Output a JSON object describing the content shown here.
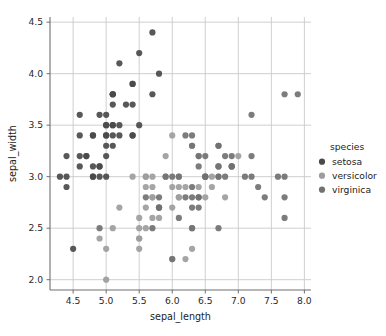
{
  "chart_data": {
    "type": "scatter",
    "title": "",
    "xlabel": "sepal_length",
    "ylabel": "sepal_width",
    "xlim": [
      4.15,
      8.1
    ],
    "ylim": [
      1.9,
      4.55
    ],
    "xticks": [
      "4.5",
      "5.0",
      "5.5",
      "6.0",
      "6.5",
      "7.0",
      "7.5",
      "8.0"
    ],
    "xtick_values": [
      4.5,
      5.0,
      5.5,
      6.0,
      6.5,
      7.0,
      7.5,
      8.0
    ],
    "yticks": [
      "2.0",
      "2.5",
      "3.0",
      "3.5",
      "4.0",
      "4.5"
    ],
    "ytick_values": [
      2.0,
      2.5,
      3.0,
      3.5,
      4.0,
      4.5
    ],
    "grid": true,
    "grid_color": "#c9c9c9",
    "axes_color": "#6f6f6f",
    "background": "#ffffff",
    "legend": {
      "title": "species",
      "position": "right",
      "entries": [
        {
          "label": "setosa",
          "color": "#4a4a4a"
        },
        {
          "label": "versicolor",
          "color": "#9d9d9d"
        },
        {
          "label": "virginica",
          "color": "#717171"
        }
      ]
    },
    "marker_size": 3.1,
    "series": [
      {
        "name": "setosa",
        "color": "#4a4a4a",
        "points": [
          [
            5.1,
            3.5
          ],
          [
            4.9,
            3.0
          ],
          [
            4.7,
            3.2
          ],
          [
            4.6,
            3.1
          ],
          [
            5.0,
            3.6
          ],
          [
            5.4,
            3.9
          ],
          [
            4.6,
            3.4
          ],
          [
            5.0,
            3.4
          ],
          [
            4.4,
            2.9
          ],
          [
            4.9,
            3.1
          ],
          [
            5.4,
            3.7
          ],
          [
            4.8,
            3.4
          ],
          [
            4.8,
            3.0
          ],
          [
            4.3,
            3.0
          ],
          [
            5.8,
            4.0
          ],
          [
            5.7,
            4.4
          ],
          [
            5.4,
            3.9
          ],
          [
            5.1,
            3.5
          ],
          [
            5.7,
            3.8
          ],
          [
            5.1,
            3.8
          ],
          [
            5.4,
            3.4
          ],
          [
            5.1,
            3.7
          ],
          [
            4.6,
            3.6
          ],
          [
            5.1,
            3.3
          ],
          [
            4.8,
            3.4
          ],
          [
            5.0,
            3.0
          ],
          [
            5.0,
            3.4
          ],
          [
            5.2,
            3.5
          ],
          [
            5.2,
            3.4
          ],
          [
            4.7,
            3.2
          ],
          [
            4.8,
            3.1
          ],
          [
            5.4,
            3.4
          ],
          [
            5.2,
            4.1
          ],
          [
            5.5,
            4.2
          ],
          [
            4.9,
            3.1
          ],
          [
            5.0,
            3.2
          ],
          [
            5.5,
            3.5
          ],
          [
            4.9,
            3.6
          ],
          [
            4.4,
            3.0
          ],
          [
            5.1,
            3.4
          ],
          [
            5.0,
            3.5
          ],
          [
            4.5,
            2.3
          ],
          [
            4.4,
            3.2
          ],
          [
            5.0,
            3.5
          ],
          [
            5.1,
            3.8
          ],
          [
            4.8,
            3.0
          ],
          [
            5.1,
            3.8
          ],
          [
            4.6,
            3.2
          ],
          [
            5.3,
            3.7
          ],
          [
            5.0,
            3.3
          ]
        ]
      },
      {
        "name": "versicolor",
        "color": "#9d9d9d",
        "points": [
          [
            7.0,
            3.2
          ],
          [
            6.4,
            3.2
          ],
          [
            6.9,
            3.1
          ],
          [
            5.5,
            2.3
          ],
          [
            6.5,
            2.8
          ],
          [
            5.7,
            2.8
          ],
          [
            6.3,
            3.3
          ],
          [
            4.9,
            2.4
          ],
          [
            6.6,
            2.9
          ],
          [
            5.2,
            2.7
          ],
          [
            5.0,
            2.0
          ],
          [
            5.9,
            3.0
          ],
          [
            6.0,
            2.2
          ],
          [
            6.1,
            2.9
          ],
          [
            5.6,
            2.9
          ],
          [
            6.7,
            3.1
          ],
          [
            5.6,
            3.0
          ],
          [
            5.8,
            2.7
          ],
          [
            6.2,
            2.2
          ],
          [
            5.6,
            2.5
          ],
          [
            5.9,
            3.2
          ],
          [
            6.1,
            2.8
          ],
          [
            6.3,
            2.5
          ],
          [
            6.1,
            2.8
          ],
          [
            6.4,
            2.9
          ],
          [
            6.6,
            3.0
          ],
          [
            6.8,
            2.8
          ],
          [
            6.7,
            3.0
          ],
          [
            6.0,
            2.9
          ],
          [
            5.7,
            2.6
          ],
          [
            5.5,
            2.4
          ],
          [
            5.5,
            2.4
          ],
          [
            5.8,
            2.7
          ],
          [
            6.0,
            2.7
          ],
          [
            5.4,
            3.0
          ],
          [
            6.0,
            3.4
          ],
          [
            6.7,
            3.1
          ],
          [
            6.3,
            2.3
          ],
          [
            5.6,
            3.0
          ],
          [
            5.5,
            2.5
          ],
          [
            5.5,
            2.6
          ],
          [
            6.1,
            3.0
          ],
          [
            5.8,
            2.6
          ],
          [
            5.0,
            2.3
          ],
          [
            5.6,
            2.7
          ],
          [
            5.7,
            3.0
          ],
          [
            5.7,
            2.9
          ],
          [
            6.2,
            2.9
          ],
          [
            5.1,
            2.5
          ],
          [
            5.7,
            2.8
          ]
        ]
      },
      {
        "name": "virginica",
        "color": "#717171",
        "points": [
          [
            6.3,
            3.3
          ],
          [
            5.8,
            2.7
          ],
          [
            7.1,
            3.0
          ],
          [
            6.3,
            2.9
          ],
          [
            6.5,
            3.0
          ],
          [
            7.6,
            3.0
          ],
          [
            4.9,
            2.5
          ],
          [
            7.3,
            2.9
          ],
          [
            6.7,
            2.5
          ],
          [
            7.2,
            3.6
          ],
          [
            6.5,
            3.2
          ],
          [
            6.4,
            2.7
          ],
          [
            6.8,
            3.0
          ],
          [
            5.7,
            2.5
          ],
          [
            5.8,
            2.8
          ],
          [
            6.4,
            3.2
          ],
          [
            6.5,
            3.0
          ],
          [
            7.7,
            3.8
          ],
          [
            7.7,
            2.6
          ],
          [
            6.0,
            2.2
          ],
          [
            6.9,
            3.2
          ],
          [
            5.6,
            2.8
          ],
          [
            7.7,
            2.8
          ],
          [
            6.3,
            2.7
          ],
          [
            6.7,
            3.3
          ],
          [
            7.2,
            3.2
          ],
          [
            6.2,
            2.8
          ],
          [
            6.1,
            3.0
          ],
          [
            6.4,
            2.8
          ],
          [
            7.2,
            3.0
          ],
          [
            7.4,
            2.8
          ],
          [
            7.9,
            3.8
          ],
          [
            6.4,
            2.8
          ],
          [
            6.3,
            2.8
          ],
          [
            6.1,
            2.6
          ],
          [
            7.7,
            3.0
          ],
          [
            6.3,
            3.4
          ],
          [
            6.4,
            3.1
          ],
          [
            6.0,
            3.0
          ],
          [
            6.9,
            3.1
          ],
          [
            6.7,
            3.1
          ],
          [
            6.9,
            3.1
          ],
          [
            5.8,
            2.7
          ],
          [
            6.8,
            3.2
          ],
          [
            6.7,
            3.3
          ],
          [
            6.7,
            3.0
          ],
          [
            6.3,
            2.5
          ],
          [
            6.5,
            3.0
          ],
          [
            6.2,
            3.4
          ],
          [
            5.9,
            3.0
          ]
        ]
      }
    ]
  }
}
